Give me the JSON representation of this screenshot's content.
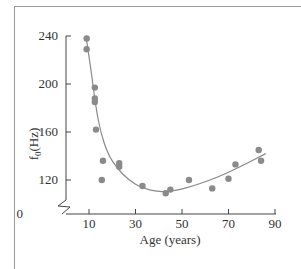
{
  "chart_data": {
    "type": "scatter",
    "title": "",
    "xlabel": "Age (years)",
    "ylabel": "f0(Hz)",
    "ylabel_main": "f",
    "ylabel_sub": "0",
    "ylabel_unit": "(Hz)",
    "xlim": [
      5,
      90
    ],
    "ylim": [
      0,
      240
    ],
    "y_axis_break": true,
    "x_ticks": [
      10,
      30,
      50,
      70,
      90
    ],
    "y_ticks": [
      0,
      120,
      160,
      200,
      240
    ],
    "grid": false,
    "legend": null,
    "points": [
      {
        "x": 9,
        "y": 238
      },
      {
        "x": 9,
        "y": 229
      },
      {
        "x": 12.5,
        "y": 197
      },
      {
        "x": 12.5,
        "y": 188
      },
      {
        "x": 12.5,
        "y": 185
      },
      {
        "x": 13,
        "y": 162
      },
      {
        "x": 16,
        "y": 136
      },
      {
        "x": 15.5,
        "y": 120
      },
      {
        "x": 23,
        "y": 134
      },
      {
        "x": 23,
        "y": 131
      },
      {
        "x": 33,
        "y": 115
      },
      {
        "x": 43,
        "y": 109
      },
      {
        "x": 45,
        "y": 112
      },
      {
        "x": 53,
        "y": 120
      },
      {
        "x": 63,
        "y": 113
      },
      {
        "x": 70,
        "y": 121
      },
      {
        "x": 73,
        "y": 133
      },
      {
        "x": 83,
        "y": 145
      },
      {
        "x": 84,
        "y": 136
      }
    ],
    "fit_curve": [
      {
        "x": 9,
        "y": 236
      },
      {
        "x": 11,
        "y": 210
      },
      {
        "x": 13,
        "y": 180
      },
      {
        "x": 15,
        "y": 160
      },
      {
        "x": 18,
        "y": 142
      },
      {
        "x": 22,
        "y": 130
      },
      {
        "x": 27,
        "y": 120
      },
      {
        "x": 33,
        "y": 113
      },
      {
        "x": 40,
        "y": 110
      },
      {
        "x": 47,
        "y": 111
      },
      {
        "x": 55,
        "y": 115
      },
      {
        "x": 65,
        "y": 122
      },
      {
        "x": 75,
        "y": 131
      },
      {
        "x": 86,
        "y": 142
      }
    ],
    "colors": {
      "point": "#8a8a8a",
      "curve": "#8a8a8a",
      "axis": "#444444"
    }
  }
}
